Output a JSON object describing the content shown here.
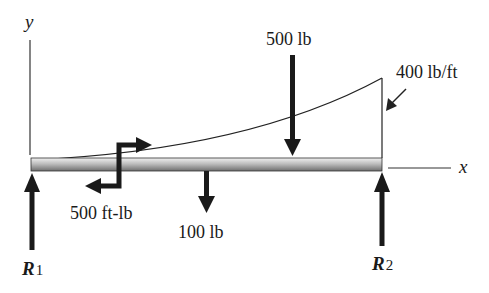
{
  "figure": {
    "type": "beam free-body diagram",
    "colors": {
      "ink": "#1a1a1a",
      "beam_light": "#e6e6e6",
      "beam_dark": "#7a7a7a",
      "background": "#ffffff"
    }
  },
  "axes": {
    "x_label": "x",
    "y_label": "y"
  },
  "loads": {
    "point_load_top": {
      "label": "500 lb",
      "direction": "down"
    },
    "point_load_bottom": {
      "label": "100 lb",
      "direction": "down"
    },
    "distributed_load": {
      "label": "400 lb/ft",
      "shape": "increasing curve from 0 to peak at right end"
    },
    "couple_moment": {
      "label": "500 ft-lb"
    }
  },
  "reactions": {
    "left": {
      "symbol": "R",
      "subscript": "1",
      "direction": "up"
    },
    "right": {
      "symbol": "R",
      "subscript": "2",
      "direction": "up"
    }
  }
}
